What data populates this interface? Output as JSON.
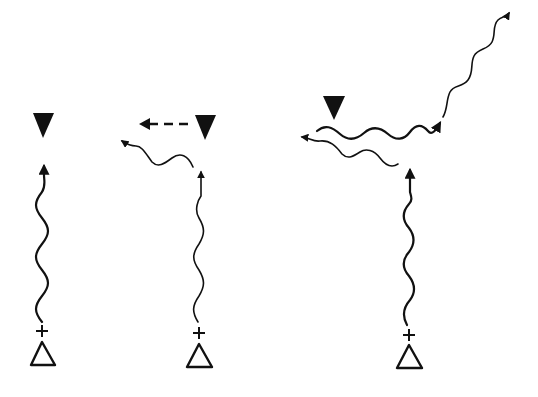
{
  "diagram": {
    "colors": {
      "ink": "#111111",
      "background": "#ffffff"
    },
    "panels": [
      {
        "id": "panel-1",
        "source_marker": "+",
        "elements": [
          "open-triangle",
          "plus",
          "vertical-wavy-arrow",
          "filled-inverted-triangle"
        ]
      },
      {
        "id": "panel-2",
        "source_marker": "+",
        "elements": [
          "open-triangle",
          "plus",
          "vertical-wavy-arrow",
          "filled-inverted-triangle",
          "dashed-arrow-left",
          "wavy-arrow-left"
        ]
      },
      {
        "id": "panel-3",
        "source_marker": "+",
        "elements": [
          "open-triangle",
          "plus",
          "vertical-wavy-arrow",
          "filled-inverted-triangle",
          "wavy-arrow-right",
          "wavy-arrow-up-right",
          "wavy-arrow-left"
        ]
      }
    ]
  }
}
